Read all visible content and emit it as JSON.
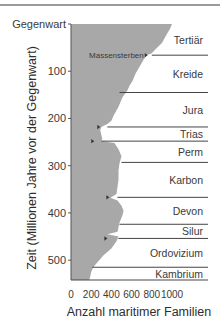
{
  "chart_data": {
    "type": "area",
    "title": "",
    "xlabel": "Anzahl maritimer Familien",
    "ylabel": "Zeit (Millionen Jahre vor der Gegenwart)",
    "xlim": [
      0,
      1000
    ],
    "ylim": [
      0,
      542
    ],
    "y_inverted": true,
    "grid": false,
    "x_ticks": [
      0,
      200,
      400,
      600,
      800,
      1000
    ],
    "x_tick_labels": [
      "0",
      "200",
      "400",
      "600",
      "800",
      "1000"
    ],
    "y_ticks": [
      0,
      100,
      200,
      300,
      400,
      500
    ],
    "y_tick_labels": [
      "Gegenwart",
      "100",
      "200",
      "300",
      "400",
      "500"
    ],
    "series": [
      {
        "name": "Maritime Familien",
        "color": "#a8a8a8",
        "points": [
          [
            0,
            1000
          ],
          [
            10,
            980
          ],
          [
            25,
            940
          ],
          [
            40,
            900
          ],
          [
            55,
            830
          ],
          [
            62,
            800
          ],
          [
            66,
            750
          ],
          [
            75,
            720
          ],
          [
            90,
            680
          ],
          [
            105,
            640
          ],
          [
            120,
            610
          ],
          [
            130,
            580
          ],
          [
            140,
            560
          ],
          [
            155,
            510
          ],
          [
            175,
            470
          ],
          [
            195,
            420
          ],
          [
            205,
            400
          ],
          [
            212,
            360
          ],
          [
            215,
            330
          ],
          [
            218,
            300
          ],
          [
            225,
            290
          ],
          [
            235,
            300
          ],
          [
            243,
            310
          ],
          [
            248,
            300
          ],
          [
            252,
            430
          ],
          [
            265,
            470
          ],
          [
            280,
            500
          ],
          [
            295,
            480
          ],
          [
            310,
            470
          ],
          [
            330,
            470
          ],
          [
            345,
            460
          ],
          [
            360,
            450
          ],
          [
            368,
            390
          ],
          [
            374,
            460
          ],
          [
            385,
            500
          ],
          [
            395,
            520
          ],
          [
            405,
            510
          ],
          [
            420,
            480
          ],
          [
            440,
            460
          ],
          [
            445,
            360
          ],
          [
            450,
            470
          ],
          [
            460,
            450
          ],
          [
            475,
            400
          ],
          [
            490,
            320
          ],
          [
            505,
            260
          ],
          [
            515,
            220
          ],
          [
            525,
            200
          ],
          [
            535,
            190
          ],
          [
            542,
            180
          ]
        ]
      }
    ],
    "periods": [
      {
        "name": "Tertiär",
        "from": 0,
        "to": 66
      },
      {
        "name": "Kreide",
        "from": 66,
        "to": 145
      },
      {
        "name": "Jura",
        "from": 145,
        "to": 218
      },
      {
        "name": "Trias",
        "from": 218,
        "to": 248
      },
      {
        "name": "Perm",
        "from": 248,
        "to": 293
      },
      {
        "name": "Karbon",
        "from": 293,
        "to": 367
      },
      {
        "name": "Devon",
        "from": 367,
        "to": 424
      },
      {
        "name": "Silur",
        "from": 424,
        "to": 454
      },
      {
        "name": "Ordovizium",
        "from": 454,
        "to": 515
      },
      {
        "name": "Kambrium",
        "from": 515,
        "to": 542
      }
    ],
    "boundaries": [
      {
        "time": 66,
        "x_start": 800
      },
      {
        "time": 145,
        "x_start": 480
      },
      {
        "time": 218,
        "x_start": 360
      },
      {
        "time": 248,
        "x_start": 300
      },
      {
        "time": 293,
        "x_start": 500
      },
      {
        "time": 367,
        "x_start": 460
      },
      {
        "time": 424,
        "x_start": 480
      },
      {
        "time": 454,
        "x_start": 470
      },
      {
        "time": 515,
        "x_start": 210
      },
      {
        "time": 542,
        "x_start": 0
      }
    ],
    "mass_extinction_markers": [
      {
        "time": 66,
        "value": 760
      },
      {
        "time": 218,
        "value": 290
      },
      {
        "time": 248,
        "value": 230
      },
      {
        "time": 367,
        "value": 380
      },
      {
        "time": 454,
        "value": 360
      }
    ],
    "annotations": [
      {
        "text": "Massensterben",
        "time": 66,
        "value": 760
      }
    ]
  }
}
